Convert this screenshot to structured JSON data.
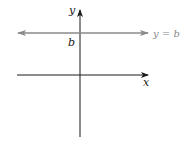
{
  "diagram": {
    "y_axis_label": "y",
    "x_axis_label": "x",
    "intercept_label": "b",
    "line_label": "y = b",
    "colors": {
      "axes": "#1a1a1a",
      "line": "#8a8a8a",
      "line_label": "#8a8a8a"
    }
  }
}
